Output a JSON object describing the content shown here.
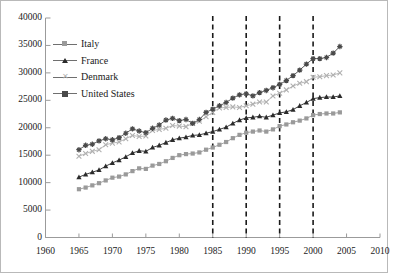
{
  "chart_data": {
    "type": "line",
    "title": "",
    "xlabel": "",
    "ylabel": "",
    "xlim": [
      1960,
      2010
    ],
    "ylim": [
      0,
      40000
    ],
    "xticks": [
      1960,
      1965,
      1970,
      1975,
      1980,
      1985,
      1990,
      1995,
      2000,
      2005,
      2010
    ],
    "yticks": [
      0,
      5000,
      10000,
      15000,
      20000,
      25000,
      30000,
      35000,
      40000
    ],
    "grid": false,
    "legend_position": "top-left",
    "annotations": {
      "vertical_dashed_lines": [
        1985,
        1990,
        1995,
        2000
      ]
    },
    "x": [
      1965,
      1966,
      1967,
      1968,
      1969,
      1970,
      1971,
      1972,
      1973,
      1974,
      1975,
      1976,
      1977,
      1978,
      1979,
      1980,
      1981,
      1982,
      1983,
      1984,
      1985,
      1986,
      1987,
      1988,
      1989,
      1990,
      1991,
      1992,
      1993,
      1994,
      1995,
      1996,
      1997,
      1998,
      1999,
      2000,
      2001,
      2002,
      2003,
      2004
    ],
    "series": [
      {
        "name": "Italy",
        "marker": "square",
        "color": "#9a9a9a",
        "values": [
          8800,
          9100,
          9500,
          9900,
          10400,
          10900,
          11100,
          11500,
          12100,
          12600,
          12500,
          13100,
          13400,
          13900,
          14500,
          15000,
          15200,
          15300,
          15500,
          16000,
          16400,
          16900,
          17400,
          18100,
          18700,
          19100,
          19300,
          19500,
          19300,
          19700,
          20300,
          20600,
          21000,
          21300,
          21700,
          22300,
          22500,
          22600,
          22600,
          22800
        ]
      },
      {
        "name": "France",
        "marker": "triangle",
        "color": "#2b2b2b",
        "values": [
          11000,
          11500,
          11900,
          12300,
          13000,
          13600,
          14100,
          14700,
          15400,
          15800,
          15700,
          16400,
          16800,
          17300,
          17800,
          18100,
          18300,
          18600,
          18700,
          19000,
          19300,
          19700,
          20100,
          20800,
          21400,
          21800,
          21900,
          22100,
          21900,
          22300,
          22700,
          22900,
          23300,
          24000,
          24600,
          25300,
          25500,
          25600,
          25600,
          25800
        ]
      },
      {
        "name": "Denmark",
        "marker": "cross",
        "color": "#b0b0b0",
        "values": [
          14800,
          15300,
          15700,
          16000,
          16900,
          17200,
          17400,
          18000,
          18600,
          18400,
          18500,
          19500,
          19700,
          19900,
          20400,
          20300,
          20200,
          20800,
          21200,
          22000,
          22800,
          23600,
          23700,
          23800,
          23700,
          24000,
          24300,
          24700,
          24700,
          25800,
          26300,
          26900,
          27600,
          28100,
          28400,
          29200,
          29300,
          29500,
          29600,
          30000
        ]
      },
      {
        "name": "United States",
        "marker": "star",
        "color": "#4a4a4a",
        "values": [
          16000,
          16800,
          17000,
          17600,
          18000,
          17800,
          18200,
          19000,
          19800,
          19400,
          19100,
          19900,
          20500,
          21400,
          21700,
          21300,
          21500,
          20800,
          21500,
          22800,
          23400,
          24000,
          24600,
          25400,
          26000,
          26200,
          25800,
          26400,
          26800,
          27300,
          27900,
          28600,
          29500,
          30500,
          31600,
          32600,
          32600,
          32800,
          33600,
          34800
        ]
      }
    ]
  },
  "axis": {
    "ytick_labels": [
      "40000",
      "35000",
      "30000",
      "25000",
      "20000",
      "15000",
      "10000",
      "5000",
      "0"
    ],
    "xtick_labels": [
      "1960",
      "1965",
      "1970",
      "1975",
      "1980",
      "1985",
      "1990",
      "1995",
      "2000",
      "2005",
      "2010"
    ]
  },
  "legend": {
    "items": [
      {
        "label": "Italy",
        "marker": "square-marker"
      },
      {
        "label": "France",
        "marker": "triangle-marker"
      },
      {
        "label": "Denmark",
        "marker": "cross-marker"
      },
      {
        "label": "United States",
        "marker": "star-marker"
      }
    ]
  }
}
